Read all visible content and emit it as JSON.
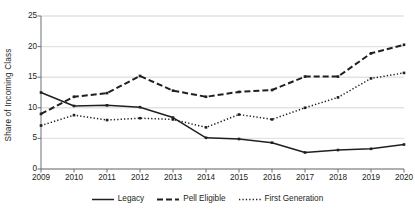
{
  "chart_data": {
    "type": "line",
    "title": "",
    "xlabel": "",
    "ylabel": "Share of Incoming Class",
    "categories": [
      "2009",
      "2010",
      "2011",
      "2012",
      "2013",
      "2014",
      "2015",
      "2016",
      "2017",
      "2018",
      "2019",
      "2020"
    ],
    "x": [
      2009,
      2010,
      2011,
      2012,
      2013,
      2014,
      2015,
      2016,
      2017,
      2018,
      2019,
      2020
    ],
    "ylim": [
      0,
      25
    ],
    "yticks": [
      0,
      5,
      10,
      15,
      20,
      25
    ],
    "ytick_labels": [
      "0",
      "5",
      "10",
      "15",
      "20",
      "25"
    ],
    "grid": "horizontal",
    "legend_position": "bottom",
    "series": [
      {
        "name": "Legacy",
        "style": "solid",
        "color": "#231f20",
        "marker": "square",
        "values": [
          12.5,
          10.3,
          10.4,
          10.1,
          8.4,
          5.1,
          4.9,
          4.3,
          2.7,
          3.1,
          3.3,
          4.0
        ]
      },
      {
        "name": "Pell Eligible",
        "style": "dashed",
        "color": "#231f20",
        "marker": "square",
        "values": [
          9.0,
          11.8,
          12.4,
          15.2,
          12.8,
          11.8,
          12.6,
          12.9,
          15.1,
          15.1,
          18.9,
          20.3
        ]
      },
      {
        "name": "First Generation",
        "style": "dotted",
        "color": "#231f20",
        "marker": "square",
        "values": [
          7.1,
          8.8,
          8.0,
          8.3,
          8.1,
          6.8,
          8.9,
          8.1,
          10.0,
          11.7,
          14.8,
          15.7
        ]
      }
    ]
  },
  "axis": {
    "y_title": "Share of Incoming Class"
  },
  "legend": {
    "items": [
      {
        "label": "Legacy"
      },
      {
        "label": "Pell Eligible"
      },
      {
        "label": "First Generation"
      }
    ]
  },
  "colors": {
    "ink": "#231f20",
    "grid": "#e3e3e5",
    "axis": "#6d6e71",
    "background": "#ffffff"
  }
}
